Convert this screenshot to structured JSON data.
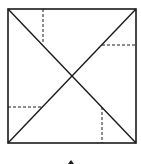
{
  "diagram": {
    "stroke_color": "#1a1a1a",
    "background": "#ffffff",
    "square": {
      "x1": 8,
      "y1": 9,
      "x2": 136,
      "y2": 143
    },
    "diagonals": [
      {
        "x1": 8,
        "y1": 9,
        "x2": 136,
        "y2": 143
      },
      {
        "x1": 8,
        "y1": 143,
        "x2": 136,
        "y2": 9
      }
    ],
    "dashed_segments": [
      {
        "x1": 43,
        "y1": 9,
        "x2": 43,
        "y2": 44
      },
      {
        "x1": 102,
        "y1": 45,
        "x2": 136,
        "y2": 45
      },
      {
        "x1": 8,
        "y1": 107,
        "x2": 42,
        "y2": 107
      },
      {
        "x1": 102,
        "y1": 107,
        "x2": 102,
        "y2": 143
      }
    ],
    "bottom_mark": {
      "cx": 71,
      "cy": 162
    }
  }
}
